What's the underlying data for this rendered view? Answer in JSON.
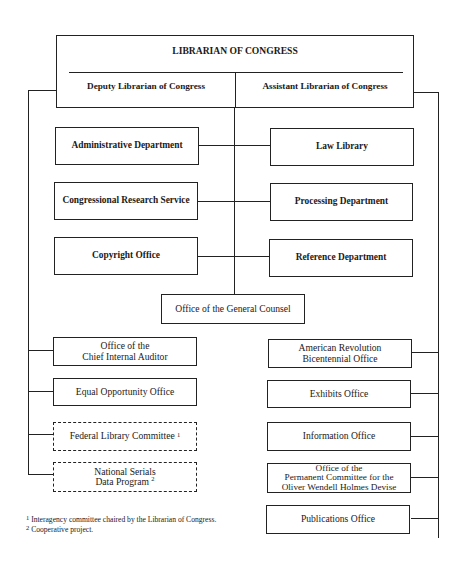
{
  "chart": {
    "title": "LIBRARIAN OF CONGRESS",
    "deputy": "Deputy Librarian of Congress",
    "assistant": "Assistant Librarian of Congress",
    "left_departments": [
      {
        "label": "Administrative Department"
      },
      {
        "label": "Congressional Research Service"
      },
      {
        "label": "Copyright Office"
      }
    ],
    "right_departments": [
      {
        "label": "Law Library"
      },
      {
        "label": "Processing Department"
      },
      {
        "label": "Reference Department"
      }
    ],
    "general_counsel": "Office of the General Counsel",
    "left_offices": [
      {
        "line1": "Office of the",
        "line2": "Chief Internal Auditor"
      },
      {
        "line1": "Equal Opportunity Office"
      },
      {
        "line1": "Federal Library Committee",
        "footnote": "1",
        "style": "dashed"
      },
      {
        "line1": "National Serials",
        "line2": "Data Program",
        "footnote": "2",
        "style": "dashed"
      }
    ],
    "right_offices": [
      {
        "line1": "American Revolution",
        "line2": "Bicentennial Office"
      },
      {
        "line1": "Exhibits Office"
      },
      {
        "line1": "Information Office"
      },
      {
        "line1": "Office of the",
        "line2": "Permanent Committee for the",
        "line3": "Oliver Wendell Holmes Devise"
      },
      {
        "line1": "Publications Office"
      }
    ]
  },
  "footnotes": [
    {
      "mark": "1",
      "text": "Interagency committee chaired by the Librarian of Congress."
    },
    {
      "mark": "2",
      "text": "Cooperative project."
    }
  ],
  "colors": {
    "line": "#222222",
    "background": "#ffffff"
  }
}
